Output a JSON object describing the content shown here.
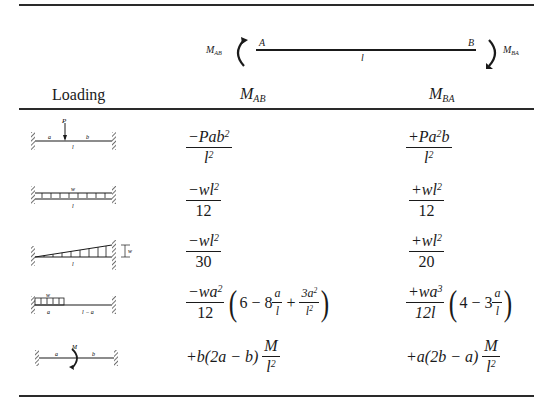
{
  "convention_diagram": {
    "left_moment_label": "M",
    "left_moment_sub": "AB",
    "right_moment_label": "M",
    "right_moment_sub": "BA",
    "end_a": "A",
    "end_b": "B",
    "span": "l"
  },
  "header": {
    "loading": "Loading",
    "col_mab": "M",
    "col_mab_sub": "AB",
    "col_mba": "M",
    "col_mba_sub": "BA"
  },
  "rows": [
    {
      "loading": "Concentrated load P at distance a from A, b from B, span l",
      "labels": {
        "load": "P",
        "a": "a",
        "b": "b",
        "l": "l"
      },
      "mab": {
        "num": "−Pab",
        "num_sup": "2",
        "den": "l",
        "den_sup": "2"
      },
      "mba": {
        "num_pre": "+Pa",
        "num_sup": "2",
        "num_post": "b",
        "den": "l",
        "den_sup": "2"
      }
    },
    {
      "loading": "Uniformly distributed load w over span l",
      "labels": {
        "load": "w",
        "l": "l"
      },
      "mab": {
        "num": "−wl",
        "num_sup": "2",
        "den": "12"
      },
      "mba": {
        "num": "+wl",
        "num_sup": "2",
        "den": "20_placeholder_fix",
        "den_value": "12"
      }
    },
    {
      "loading": "Triangular load increasing to w at B, span l",
      "labels": {
        "load": "w",
        "l": "l"
      },
      "mab": {
        "num": "−wl",
        "num_sup": "2",
        "den": "30"
      },
      "mba": {
        "num": "+wl",
        "num_sup": "2",
        "den": "20"
      }
    },
    {
      "loading": "Uniform load w over length a from A, remaining l − a unloaded",
      "labels": {
        "load": "w",
        "a": "a",
        "rest": "l − a"
      },
      "mab": {
        "num": "−wa",
        "num_sup": "2",
        "den": "12",
        "paren": {
          "t1": "6 − 8",
          "f1_num": "a",
          "f1_den": "l",
          "op": " + ",
          "f2_num": "3a",
          "f2_num_sup": "2",
          "f2_den": "l",
          "f2_den_sup": "2"
        }
      },
      "mba": {
        "num": "+wa",
        "num_sup": "3",
        "den": "12l",
        "paren": {
          "t1": "4 − 3",
          "f1_num": "a",
          "f1_den": "l"
        }
      }
    },
    {
      "loading": "Applied moment M at distance a from A, b from B",
      "labels": {
        "load": "M",
        "a": "a",
        "b": "b"
      },
      "mab": {
        "pre": "+b(2a − b)",
        "f_num": "M",
        "f_den": "l",
        "f_den_sup": "2"
      },
      "mba": {
        "pre": "+a(2b − a)",
        "f_num": "M",
        "f_den": "l",
        "f_den_sup": "2"
      }
    }
  ]
}
